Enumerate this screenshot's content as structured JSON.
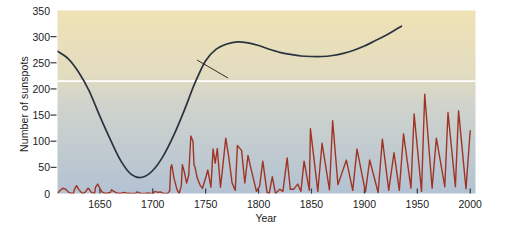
{
  "figure": {
    "background_color": "#ffffff",
    "plot_top_color": "#efe2b4",
    "plot_bottom_color": "#b3c2d3",
    "sunspot_line_color": "#a03424",
    "winter_line_color": "#2a3340",
    "reference_line_color": "#ffffff"
  },
  "annotations": {
    "winter_label_line1": "Winter severity in",
    "winter_label_line2": "London and Paris",
    "warm_label": "warm",
    "cold_label": "cold",
    "warm_arrow": "↑",
    "cold_arrow": "↓"
  },
  "chart_data": {
    "type": "line",
    "title": "",
    "xlabel": "Year",
    "ylabel": "Number of sunspots",
    "xlim": [
      1610,
      2005
    ],
    "ylim": [
      0,
      350
    ],
    "xticks": [
      1650,
      1700,
      1750,
      1800,
      1850,
      1900,
      1950,
      2000
    ],
    "yticks": [
      0,
      50,
      100,
      150,
      200,
      250,
      300,
      350
    ],
    "grid": false,
    "legend": "none",
    "reference_line": {
      "orientation": "horizontal",
      "y": 215,
      "label_above": "warm",
      "label_below": "cold",
      "color": "#ffffff"
    },
    "series": [
      {
        "name": "Number of sunspots",
        "color": "#a03424",
        "axis": "y",
        "x": [
          1610,
          1612,
          1615,
          1618,
          1620,
          1622,
          1625,
          1626,
          1628,
          1630,
          1632,
          1634,
          1636,
          1639,
          1640,
          1642,
          1645,
          1646,
          1648,
          1650,
          1652,
          1655,
          1660,
          1661,
          1664,
          1666,
          1670,
          1672,
          1675,
          1679,
          1684,
          1685,
          1689,
          1693,
          1695,
          1698,
          1700,
          1702,
          1705,
          1707,
          1708,
          1710,
          1712,
          1714,
          1716,
          1717,
          1718,
          1720,
          1723,
          1725,
          1727,
          1728,
          1730,
          1732,
          1734,
          1736,
          1738,
          1739,
          1740,
          1742,
          1745,
          1747,
          1750,
          1752,
          1755,
          1757,
          1759,
          1761,
          1764,
          1766,
          1769,
          1772,
          1775,
          1778,
          1780,
          1784,
          1787,
          1790,
          1793,
          1798,
          1801,
          1804,
          1808,
          1810,
          1813,
          1816,
          1820,
          1823,
          1827,
          1830,
          1833,
          1837,
          1840,
          1843,
          1848,
          1849,
          1856,
          1860,
          1867,
          1870,
          1875,
          1883,
          1889,
          1893,
          1901,
          1905,
          1913,
          1917,
          1923,
          1928,
          1933,
          1937,
          1944,
          1947,
          1954,
          1957,
          1964,
          1968,
          1976,
          1979,
          1986,
          1989,
          1996,
          2000
        ],
        "y": [
          0,
          5,
          10,
          8,
          3,
          1,
          0,
          8,
          15,
          8,
          3,
          0,
          2,
          10,
          8,
          2,
          0,
          12,
          18,
          10,
          3,
          0,
          2,
          7,
          3,
          1,
          0,
          2,
          1,
          0,
          0,
          3,
          0,
          0,
          1,
          0,
          0,
          4,
          2,
          3,
          2,
          0,
          0,
          0,
          5,
          50,
          55,
          30,
          7,
          0,
          15,
          55,
          40,
          20,
          35,
          110,
          100,
          55,
          50,
          30,
          15,
          10,
          30,
          45,
          12,
          85,
          58,
          86,
          12,
          48,
          106,
          67,
          20,
          6,
          92,
          82,
          20,
          73,
          46,
          4,
          14,
          62,
          2,
          0,
          32,
          0,
          8,
          4,
          68,
          8,
          8,
          18,
          4,
          62,
          6,
          124,
          4,
          96,
          7,
          139,
          17,
          64,
          6,
          85,
          3,
          64,
          2,
          104,
          6,
          78,
          6,
          114,
          10,
          152,
          4,
          190,
          10,
          106,
          13,
          155,
          13,
          158,
          9,
          120
        ]
      },
      {
        "name": "Winter severity in London and Paris",
        "color": "#2a3340",
        "axis": "y-proxy",
        "note": "Plotted against the same vertical frame as an index of winter severity; higher = warmer.",
        "x": [
          1610,
          1620,
          1630,
          1640,
          1650,
          1660,
          1670,
          1680,
          1690,
          1700,
          1710,
          1720,
          1730,
          1740,
          1750,
          1760,
          1770,
          1780,
          1790,
          1800,
          1810,
          1820,
          1830,
          1840,
          1850,
          1860,
          1870,
          1880,
          1890,
          1900,
          1910,
          1920,
          1930,
          1935
        ],
        "y": [
          272,
          258,
          232,
          196,
          148,
          103,
          62,
          36,
          31,
          44,
          72,
          112,
          160,
          212,
          254,
          276,
          286,
          290,
          288,
          283,
          276,
          270,
          266,
          263,
          262,
          262,
          264,
          268,
          274,
          282,
          292,
          302,
          314,
          320
        ]
      }
    ]
  }
}
